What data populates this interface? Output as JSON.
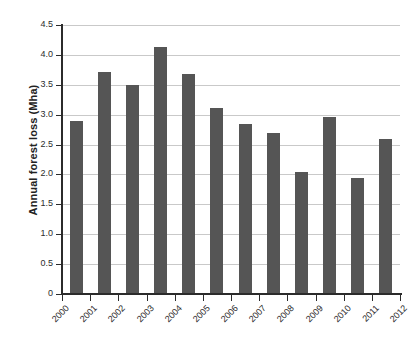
{
  "chart_data": {
    "type": "bar",
    "title": "",
    "xlabel": "",
    "ylabel": "Annual forest loss (Mha)",
    "categories": [
      "2000",
      "2001",
      "2002",
      "2003",
      "2004",
      "2005",
      "2006",
      "2007",
      "2008",
      "2009",
      "2010",
      "2011"
    ],
    "values": [
      2.9,
      3.71,
      3.49,
      4.14,
      3.68,
      3.12,
      2.84,
      2.7,
      2.04,
      2.96,
      1.94,
      2.6
    ],
    "x_tick_labels": [
      "2000",
      "2001",
      "2002",
      "2003",
      "2004",
      "2005",
      "2006",
      "2007",
      "2008",
      "2009",
      "2010",
      "2011",
      "2012"
    ],
    "y_tick_labels": [
      "0",
      "0.5",
      "1.0",
      "1.5",
      "2.0",
      "2.5",
      "3.0",
      "3.5",
      "4.0",
      "4.5"
    ],
    "y_tick_values": [
      0,
      0.5,
      1.0,
      1.5,
      2.0,
      2.5,
      3.0,
      3.5,
      4.0,
      4.5
    ],
    "ylim": [
      0,
      4.5
    ],
    "grid": true,
    "legend": "none",
    "bar_color": "#555555",
    "grid_color": "#c9c9c9",
    "axis_color": "#2b2b2b"
  }
}
